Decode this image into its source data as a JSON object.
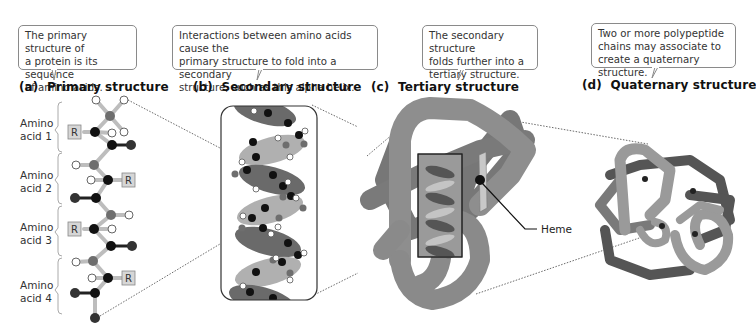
{
  "panels": [
    {
      "letter": "(a)",
      "title": "Primary structure",
      "callout": [
        "The primary structure of",
        "a protein is its sequence",
        "of amino acids."
      ]
    },
    {
      "letter": "(b)",
      "title": "Secondary structure",
      "callout": [
        "Interactions between amino acids cause the",
        "primary structure to fold into a secondary",
        "structure, such as this alpha helix."
      ]
    },
    {
      "letter": "(c)",
      "title": "Tertiary structure",
      "callout": [
        "The secondary structure",
        "folds further into a",
        "tertiary structure."
      ]
    },
    {
      "letter": "(d)",
      "title": "Quaternary structure",
      "callout": [
        "Two or more polypeptide",
        "chains may associate to",
        "create a quaternary structure."
      ]
    }
  ],
  "amino_acids": [
    {
      "line1": "Amino",
      "line2": "acid 1"
    },
    {
      "line1": "Amino",
      "line2": "acid 2"
    },
    {
      "line1": "Amino",
      "line2": "acid 3"
    },
    {
      "line1": "Amino",
      "line2": "acid 4"
    }
  ],
  "r_group_label": "R",
  "heme_label": "Heme",
  "colors": {
    "dark": "#111111",
    "mid": "#6e6e6e",
    "light": "#b4b4b4",
    "chain_light": "#a8a8a8",
    "chain_dark": "#666666"
  }
}
